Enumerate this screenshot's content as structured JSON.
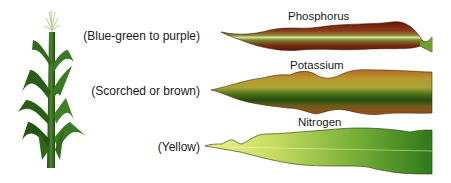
{
  "diagram": {
    "deficiencies": [
      {
        "nutrient": "Phosphorus",
        "symptom": "(Blue-green to purple)",
        "colors": {
          "edge": "#7a1a10",
          "mid": "#8a6a2a",
          "center": "#c8d890"
        }
      },
      {
        "nutrient": "Potassium",
        "symptom": "(Scorched or brown)",
        "colors": {
          "edge": "#a8561e",
          "mid": "#a89a3a",
          "center": "#2e5a12"
        }
      },
      {
        "nutrient": "Nitrogen",
        "symptom": "(Yellow)",
        "colors": {
          "tip": "#eef08a",
          "base": "#3e8a1e",
          "outline": "#3a4a1a"
        }
      }
    ]
  }
}
